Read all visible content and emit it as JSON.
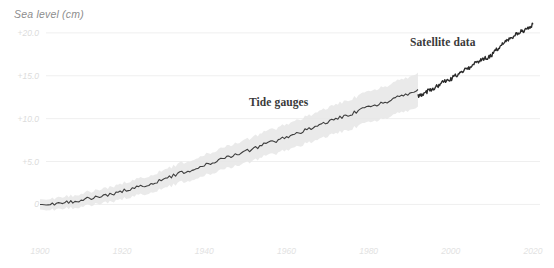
{
  "chart_data": {
    "type": "line",
    "title": "",
    "ylabel": "Sea level (cm)",
    "xlabel": "",
    "xlim": [
      1900,
      2020
    ],
    "ylim": [
      -1.0,
      21.5
    ],
    "grid": true,
    "legend_position": "inline-annotations",
    "yticks": [
      "0",
      "+5.0",
      "+10.0",
      "+15.0",
      "+20.0"
    ],
    "ytick_values": [
      0,
      5,
      10,
      15,
      20
    ],
    "xticks": [
      "1900",
      "1920",
      "1940",
      "1960",
      "1980",
      "2000",
      "2020"
    ],
    "xtick_values": [
      1900,
      1920,
      1940,
      1960,
      1980,
      2000,
      2020
    ],
    "annotations": [
      {
        "text": "Tide gauges",
        "x": 1958,
        "y": 11.8
      },
      {
        "text": "Satellite data",
        "x": 2001,
        "y": 18.3
      }
    ],
    "series": [
      {
        "name": "Tide gauges",
        "color": "#3f3f3f",
        "band_color": "#e6e6e6",
        "x": [
          1900,
          1902,
          1904,
          1906,
          1908,
          1910,
          1912,
          1914,
          1916,
          1918,
          1920,
          1922,
          1924,
          1926,
          1928,
          1930,
          1932,
          1934,
          1936,
          1938,
          1940,
          1942,
          1944,
          1946,
          1948,
          1950,
          1952,
          1954,
          1956,
          1958,
          1960,
          1962,
          1964,
          1966,
          1968,
          1970,
          1972,
          1974,
          1976,
          1978,
          1980,
          1982,
          1984,
          1986,
          1988,
          1990,
          1992
        ],
        "values": [
          0.0,
          0.15,
          0.0,
          0.35,
          0.3,
          0.55,
          0.7,
          0.9,
          1.05,
          1.3,
          1.5,
          1.85,
          2.0,
          2.3,
          2.6,
          2.9,
          3.3,
          3.6,
          3.9,
          4.3,
          4.6,
          4.9,
          5.2,
          5.6,
          5.9,
          6.2,
          6.5,
          6.9,
          7.2,
          7.5,
          7.9,
          8.2,
          8.5,
          8.9,
          9.2,
          9.6,
          9.9,
          10.3,
          10.6,
          11.0,
          11.3,
          11.6,
          11.9,
          12.3,
          12.6,
          13.0,
          13.4
        ],
        "band_half_width": 1.1
      },
      {
        "name": "Satellite data",
        "color": "#2d2d2d",
        "x": [
          1992,
          1994,
          1996,
          1998,
          2000,
          2002,
          2004,
          2006,
          2008,
          2010,
          2012,
          2014,
          2016,
          2018,
          2020
        ],
        "values": [
          12.6,
          13.1,
          13.6,
          14.2,
          14.6,
          15.3,
          15.8,
          16.5,
          16.9,
          17.4,
          18.5,
          19.1,
          19.8,
          20.4,
          21.0
        ]
      }
    ]
  },
  "ylabel_text": "Sea level (cm)",
  "annotations": {
    "tide_gauges": "Tide gauges",
    "satellite_data": "Satellite data"
  }
}
